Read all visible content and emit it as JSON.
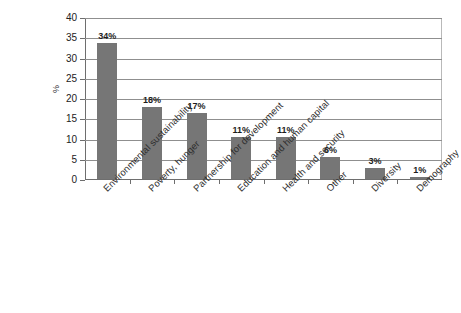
{
  "chart_data": {
    "type": "bar",
    "title": "",
    "subtitle": "",
    "xlabel": "",
    "ylabel": "%",
    "ylim": [
      0,
      40
    ],
    "ytick_step": 5,
    "yticks": [
      0,
      5,
      10,
      15,
      20,
      25,
      30,
      35,
      40
    ],
    "ytick_labels": [
      "0",
      "5",
      "10",
      "15",
      "20",
      "25",
      "30",
      "35",
      "40"
    ],
    "grid": "horizontal",
    "legend": "none",
    "categories": [
      "Environmental sustainability",
      "Poverty, hunger",
      "Partnership for development",
      "Education and human capital",
      "Health and security",
      "Other",
      "Diversity",
      "Demography"
    ],
    "values": [
      33.5,
      17.7,
      16.3,
      10.4,
      10.3,
      5.4,
      2.7,
      0.4
    ],
    "data_labels": [
      "34%",
      "18%",
      "17%",
      "11%",
      "11%",
      "6%",
      "3%",
      "1%"
    ],
    "bar_color": "#767676",
    "gridline_color": "#8f8f8f",
    "axis_color": "#6e6e6e",
    "background_color": "#ffffff"
  }
}
